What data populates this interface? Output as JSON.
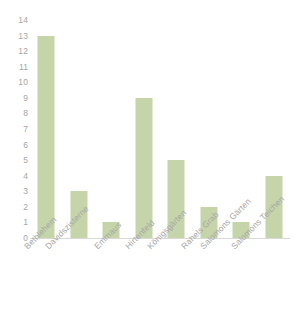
{
  "chart_data": {
    "type": "bar",
    "title": "",
    "subtitle": "",
    "xlabel": "",
    "ylabel": "",
    "categories": [
      "Bethlehem",
      "Davidszisterne",
      "Emmaus",
      "Hirtenfeld",
      "Königsgärten",
      "Rahels Grab",
      "Salomons Gärten",
      "Salomons Teichen"
    ],
    "values": [
      13,
      3,
      1,
      9,
      5,
      2,
      1,
      4
    ],
    "ylim": [
      0,
      14
    ],
    "ytick_step": 1,
    "yticks": [
      14,
      13,
      12,
      11,
      10,
      9,
      8,
      7,
      6,
      5,
      4,
      3,
      2,
      1,
      0
    ],
    "ytick_labels": [
      "14",
      "13",
      "12",
      "11",
      "10",
      "9",
      "8",
      "7",
      "6",
      "5",
      "4",
      "3",
      "2",
      "1",
      "0"
    ],
    "grid": false,
    "legend": false,
    "legend_position": "none",
    "bar_color": "#c6d5a9",
    "axis_color": "#d9d9d9",
    "tick_label_color": "#a6a6a6",
    "background_color": "#ffffff",
    "xtick_label_rotation": -45
  }
}
